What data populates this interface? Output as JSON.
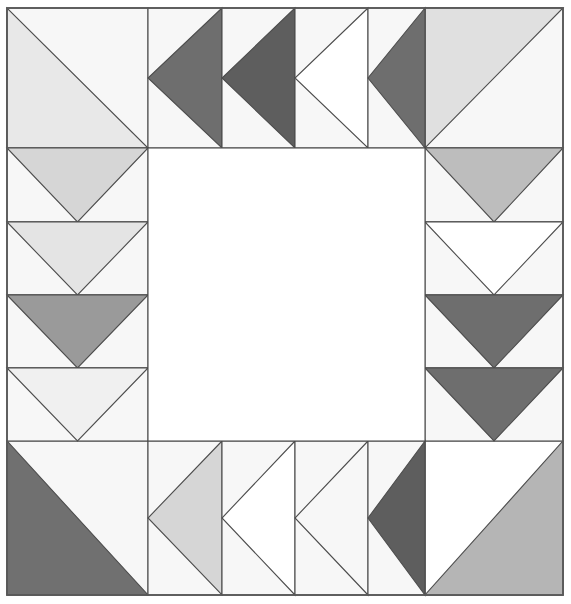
{
  "artwork": {
    "title": "Quilt Block Pattern",
    "type": "quilt-block",
    "canvas_width": 571,
    "canvas_height": 604,
    "block_left": 7,
    "block_top": 8,
    "block_right": 563,
    "block_bottom": 595,
    "grid_columns": 6,
    "grid_rows": 6,
    "column_edges": [
      7,
      148,
      222,
      295,
      368,
      425,
      563
    ],
    "row_edges": [
      8,
      148,
      222,
      295,
      368,
      441,
      595
    ],
    "outline_color": "#4d4d4d",
    "frame_color": "#595959",
    "background_color": "#f7f7f7",
    "center_color": "#ffffff"
  },
  "palette": {
    "white": "#ffffff",
    "off_white": "#f7f7f7",
    "very_light_gray": "#f0f0f0",
    "light_gray": "#e4e4e4",
    "light_mid_gray": "#d6d6d6",
    "mid_gray": "#bdbdbd",
    "mid_gray_b": "#b5b5b5",
    "med_dark_gray": "#9a9a9a",
    "dark_gray": "#707070",
    "darker_gray": "#6e6e6e",
    "darkest_gray": "#5e5e5e"
  },
  "corners": [
    {
      "name": "top-left-corner",
      "position": "top-left",
      "x": 7,
      "y": 8,
      "w": 141,
      "h": 140,
      "triangle_orientation": "lower-left",
      "triangle_color": "#e8e8e8",
      "background_color": "#f7f7f7"
    },
    {
      "name": "top-right-corner",
      "position": "top-right",
      "x": 425,
      "y": 8,
      "w": 138,
      "h": 140,
      "triangle_orientation": "upper-left",
      "triangle_color": "#e0e0e0",
      "background_color": "#f7f7f7"
    },
    {
      "name": "bottom-left-corner",
      "position": "bottom-left",
      "x": 7,
      "y": 441,
      "w": 141,
      "h": 154,
      "triangle_orientation": "lower-left",
      "triangle_color": "#707070",
      "background_color": "#f7f7f7"
    },
    {
      "name": "bottom-right-corner",
      "position": "bottom-right",
      "x": 425,
      "y": 441,
      "w": 138,
      "h": 154,
      "triangle_orientation": "lower-right",
      "triangle_color": "#b5b5b5",
      "background_color": "#ffffff"
    }
  ],
  "geese": {
    "top_row": [
      {
        "name": "goose-top-1",
        "x": 148,
        "y": 8,
        "w": 74,
        "h": 140,
        "point": "left",
        "triangle_color": "#6e6e6e",
        "background_color": "#f7f7f7"
      },
      {
        "name": "goose-top-2",
        "x": 222,
        "y": 8,
        "w": 73,
        "h": 140,
        "point": "left",
        "triangle_color": "#5e5e5e",
        "background_color": "#f7f7f7"
      },
      {
        "name": "goose-top-3",
        "x": 295,
        "y": 8,
        "w": 73,
        "h": 140,
        "point": "left",
        "triangle_color": "#ffffff",
        "background_color": "#f7f7f7"
      },
      {
        "name": "goose-top-4",
        "x": 368,
        "y": 8,
        "w": 57,
        "h": 140,
        "point": "left",
        "triangle_color": "#6e6e6e",
        "background_color": "#f7f7f7"
      }
    ],
    "left_column": [
      {
        "name": "goose-left-1",
        "x": 7,
        "y": 148,
        "w": 141,
        "h": 74,
        "point": "down",
        "triangle_color": "#d6d6d6",
        "background_color": "#f7f7f7"
      },
      {
        "name": "goose-left-2",
        "x": 7,
        "y": 222,
        "w": 141,
        "h": 73,
        "point": "down",
        "triangle_color": "#e4e4e4",
        "background_color": "#f7f7f7"
      },
      {
        "name": "goose-left-3",
        "x": 7,
        "y": 295,
        "w": 141,
        "h": 73,
        "point": "down",
        "triangle_color": "#9a9a9a",
        "background_color": "#f7f7f7"
      },
      {
        "name": "goose-left-4",
        "x": 7,
        "y": 368,
        "w": 141,
        "h": 73,
        "point": "down",
        "triangle_color": "#f0f0f0",
        "background_color": "#f7f7f7"
      }
    ],
    "right_column": [
      {
        "name": "goose-right-1",
        "x": 425,
        "y": 148,
        "w": 138,
        "h": 74,
        "point": "down",
        "triangle_color": "#bdbdbd",
        "background_color": "#f7f7f7"
      },
      {
        "name": "goose-right-2",
        "x": 425,
        "y": 222,
        "w": 138,
        "h": 73,
        "point": "down",
        "triangle_color": "#ffffff",
        "background_color": "#f7f7f7"
      },
      {
        "name": "goose-right-3",
        "x": 425,
        "y": 295,
        "w": 138,
        "h": 73,
        "point": "down",
        "triangle_color": "#6e6e6e",
        "background_color": "#f7f7f7"
      },
      {
        "name": "goose-right-4",
        "x": 425,
        "y": 368,
        "w": 138,
        "h": 73,
        "point": "down",
        "triangle_color": "#6e6e6e",
        "background_color": "#f7f7f7"
      }
    ],
    "bottom_row": [
      {
        "name": "goose-bottom-1",
        "x": 148,
        "y": 441,
        "w": 74,
        "h": 154,
        "point": "left",
        "triangle_color": "#d6d6d6",
        "background_color": "#f7f7f7"
      },
      {
        "name": "goose-bottom-2",
        "x": 222,
        "y": 441,
        "w": 73,
        "h": 154,
        "point": "left",
        "triangle_color": "#ffffff",
        "background_color": "#f7f7f7"
      },
      {
        "name": "goose-bottom-3",
        "x": 295,
        "y": 441,
        "w": 73,
        "h": 154,
        "point": "left",
        "triangle_color": "#f7f7f7",
        "background_color": "#f7f7f7"
      },
      {
        "name": "goose-bottom-4",
        "x": 368,
        "y": 441,
        "w": 57,
        "h": 154,
        "point": "left",
        "triangle_color": "#5e5e5e",
        "background_color": "#f7f7f7"
      }
    ]
  },
  "center": {
    "name": "center-panel",
    "x": 148,
    "y": 148,
    "w": 277,
    "h": 293,
    "color": "#ffffff"
  }
}
